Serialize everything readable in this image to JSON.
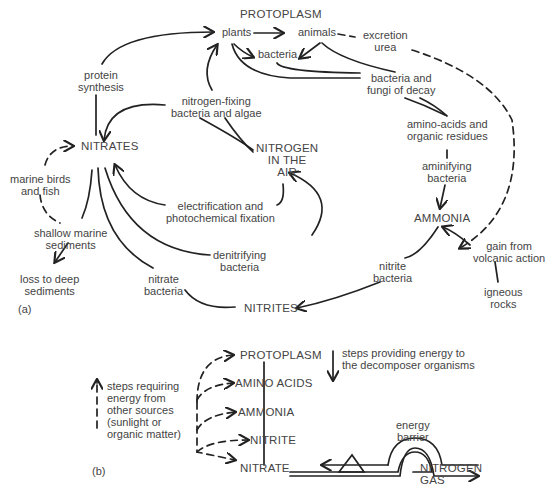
{
  "panel_a": {
    "label": "(a)",
    "nodes": {
      "protoplasm": "PROTOPLASM",
      "plants": "plants",
      "animals": "animals",
      "excretion": "excretion\nurea",
      "bacteria": "bacteria",
      "decay": "bacteria and\nfungi of decay",
      "amino": "amino-acids and\norganic residues",
      "aminifying": "aminifying\nbacteria",
      "ammonia": "AMMONIA",
      "volcanic": "gain from\nvolcanic action",
      "igneous": "igneous\nrocks",
      "nitrite_bacteria": "nitrite\nbacteria",
      "nitrites": "NITRITES",
      "nitrate_bacteria": "nitrate\nbacteria",
      "denitrifying": "denitrifying\nbacteria",
      "electrification": "electrification and\nphotochemical fixation",
      "nitrogen_air": "NITROGEN\nIN THE\nAIR",
      "fixing": "nitrogen-fixing\nbacteria and algae",
      "protein": "protein\nsynthesis",
      "nitrates": "NITRATES",
      "birds": "marine birds\nand fish",
      "shallow": "shallow marine\nsediments",
      "loss": "loss to deep\nsediments"
    }
  },
  "panel_b": {
    "label": "(b)",
    "levels": [
      "PROTOPLASM",
      "AMINO ACIDS",
      "AMMONIA",
      "NITRITE",
      "NITRATE"
    ],
    "legend_up": "steps requiring\nenergy from\nother sources\n(sunlight or\norganic matter)",
    "legend_down": "steps providing energy to\nthe decomposer organisms",
    "barrier": "energy\nbarrier",
    "gas": "NITROGEN\nGAS"
  }
}
